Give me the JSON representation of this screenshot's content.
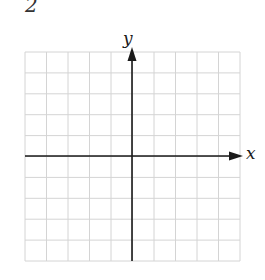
{
  "problem": {
    "number": "2"
  },
  "axes": {
    "x_label": "x",
    "y_label": "y"
  },
  "grid": {
    "columns": 10,
    "rows": 10,
    "left": 25,
    "top": 52,
    "right": 240,
    "bottom": 261,
    "origin_x": 132,
    "origin_y": 156,
    "grid_color": "#d4d4d4",
    "axis_color": "#1a1a1a"
  }
}
